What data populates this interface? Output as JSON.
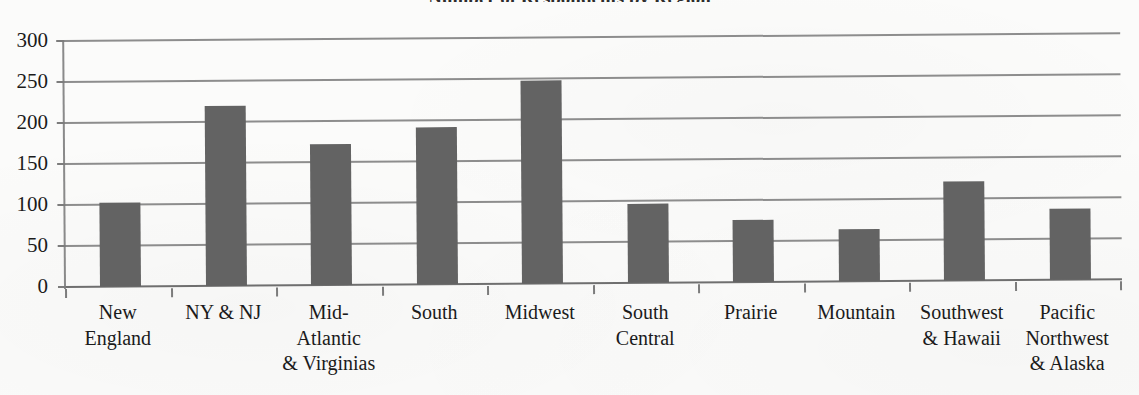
{
  "chart_data": {
    "type": "bar",
    "title": "Number of Respondents by Region",
    "title_clipped": true,
    "xlabel": "",
    "ylabel": "",
    "ylim": [
      0,
      300
    ],
    "ytick_step": 50,
    "yticks": [
      "300",
      "250",
      "200",
      "150",
      "100",
      "50",
      "0"
    ],
    "grid": true,
    "legend": "none",
    "bar_color": "#636363",
    "gridline_color": "#8d8d8d",
    "background_color": "#fbfbfa",
    "categories": [
      "New\nEngland",
      "NY & NJ",
      "Mid-\nAtlantic\n& Virginias",
      "South",
      "Midwest",
      "South\nCentral",
      "Prairie",
      "Mountain",
      "Southwest\n& Hawaii",
      "Pacific\nNorthwest\n& Alaska"
    ],
    "values": [
      103,
      219,
      172,
      191,
      248,
      96,
      76,
      63,
      121,
      87
    ]
  }
}
